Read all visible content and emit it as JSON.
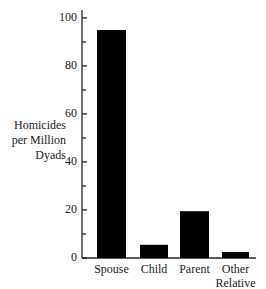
{
  "chart_data": {
    "type": "bar",
    "title": "",
    "xlabel": "",
    "ylabel": "Homicides per Million Dyads",
    "ylabel_lines": [
      "Homicides",
      "per Million",
      "Dyads"
    ],
    "categories": [
      "Spouse",
      "Child",
      "Parent",
      "Other Relative"
    ],
    "category_lines": [
      [
        "Spouse"
      ],
      [
        "Child"
      ],
      [
        "Parent"
      ],
      [
        "Other",
        "Relative"
      ]
    ],
    "values": [
      95,
      5.5,
      19.5,
      2.5
    ],
    "ylim": [
      0,
      100
    ],
    "yticks": [
      0,
      20,
      40,
      60,
      80,
      100
    ],
    "minor_ticks": [
      10,
      30,
      50,
      70,
      90
    ],
    "grid": false,
    "bar_color": "#000000"
  }
}
